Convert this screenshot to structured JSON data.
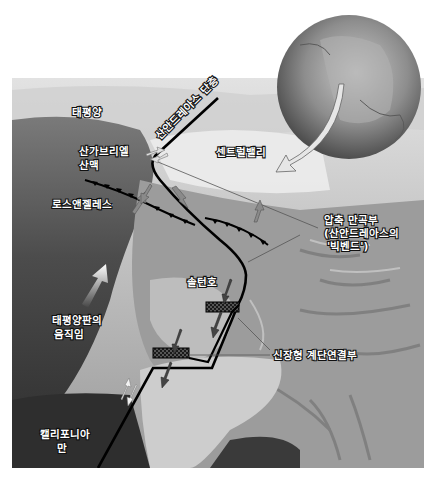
{
  "diagram": {
    "title": "산안드레아스 단층",
    "colors": {
      "background": "#ffffff",
      "ocean_dark": "#3a3a3a",
      "land_light": "#c8c8c8",
      "fault_line": "#000000",
      "arrow_gray": "#8a8a8a",
      "arrow_white": "#f4f4f4",
      "globe": "#8c8c8c"
    },
    "labels": {
      "pacific_ocean": "태평양",
      "san_andreas_fault": "산안드레아스 단층",
      "san_gabriel_mountains_line1": "산가브리엘",
      "san_gabriel_mountains_line2": "산맥",
      "central_valley": "센트럴밸리",
      "los_angeles": "로스앤젤레스",
      "compression_bend_line1": "압축 만곡부",
      "compression_bend_line2": "(산안드레아스의",
      "compression_bend_line3": "'빅벤드')",
      "salton_sea": "솔턴호",
      "pacific_plate_motion_line1": "태평양판의",
      "pacific_plate_motion_line2": "움직임",
      "extensional_stepover": "신장형 계단연결부",
      "gulf_of_california_line1": "캘리포니아",
      "gulf_of_california_line2": "만"
    },
    "icons": {
      "globe": "earth-globe-icon",
      "locator_arrow": "curved-arrow-icon",
      "plate_motion_arrow": "white-arrow-icon",
      "city_marker": "dot-icon"
    }
  }
}
